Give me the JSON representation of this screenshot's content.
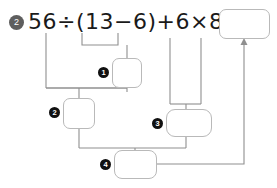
{
  "problem": {
    "number": "2",
    "expression": "56÷(13−6)+6×8=",
    "operands": [
      "56",
      "13",
      "6",
      "6",
      "8"
    ],
    "operators": [
      "÷",
      "−",
      "+",
      "×",
      "="
    ],
    "answer_value": "",
    "answer_placeholder": ""
  },
  "steps": [
    {
      "marker": "1",
      "label": "step-1",
      "value": "",
      "source": "(13−6)"
    },
    {
      "marker": "2",
      "label": "step-2",
      "value": "",
      "source": "56÷ step-1"
    },
    {
      "marker": "3",
      "label": "step-3",
      "value": "",
      "source": "6×8"
    },
    {
      "marker": "4",
      "label": "step-4",
      "value": "",
      "source": "step-2 + step-3"
    }
  ],
  "colors": {
    "badge_background": "#5e5e5e",
    "badge_text": "#ffffff",
    "marker_background": "#111111",
    "marker_text": "#ffffff",
    "box_border": "#b9b9b9",
    "connector_line": "#8f8f8f",
    "expression_text": "#1a1a1a",
    "page_background": "#ffffff"
  }
}
